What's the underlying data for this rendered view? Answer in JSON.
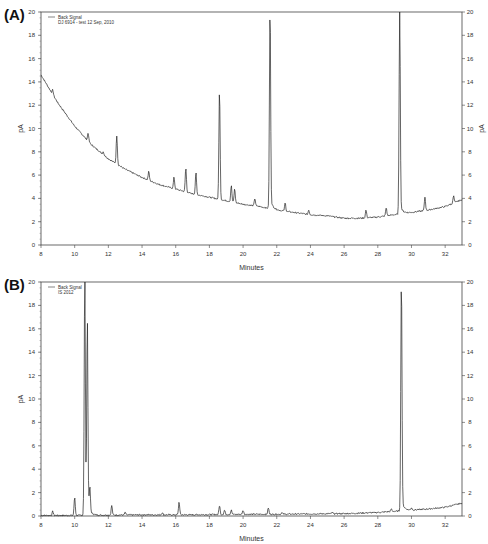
{
  "chart_data": [
    {
      "panel": "(A)",
      "type": "line",
      "title": "",
      "xlabel": "Minutes",
      "ylabel": "pA",
      "ylabel_right": "pA",
      "xlim": [
        8,
        33
      ],
      "ylim": [
        0,
        20
      ],
      "xticks": [
        8,
        10,
        12,
        14,
        16,
        18,
        20,
        22,
        24,
        26,
        28,
        30,
        32
      ],
      "yticks": [
        0,
        2,
        4,
        6,
        8,
        10,
        12,
        14,
        16,
        18,
        20
      ],
      "grid": false,
      "legend": {
        "position": "top-left",
        "entries": [
          "Back Signal",
          "DJ 6914 - test 12 Sep, 2010"
        ]
      },
      "baseline": {
        "x": [
          8,
          9,
          10,
          11,
          12,
          13,
          14,
          15,
          16,
          17,
          18,
          19,
          20,
          21,
          22,
          23,
          24,
          25,
          26,
          27,
          28,
          29,
          30,
          31,
          32,
          33
        ],
        "y": [
          14.6,
          12.2,
          10.2,
          8.6,
          7.4,
          6.5,
          5.8,
          5.2,
          4.8,
          4.4,
          4.1,
          3.8,
          3.5,
          3.3,
          3.0,
          2.8,
          2.6,
          2.5,
          2.3,
          2.3,
          2.4,
          2.6,
          2.8,
          3.0,
          3.3,
          3.9
        ]
      },
      "peaks": [
        {
          "x": 8.7,
          "y": 13.3
        },
        {
          "x": 10.8,
          "y": 9.6
        },
        {
          "x": 11.7,
          "y": 8.0
        },
        {
          "x": 12.5,
          "y": 9.4
        },
        {
          "x": 14.4,
          "y": 6.3
        },
        {
          "x": 15.9,
          "y": 5.8
        },
        {
          "x": 16.6,
          "y": 6.6
        },
        {
          "x": 17.2,
          "y": 6.2
        },
        {
          "x": 18.6,
          "y": 13.3
        },
        {
          "x": 19.3,
          "y": 5.1
        },
        {
          "x": 19.5,
          "y": 4.8
        },
        {
          "x": 20.7,
          "y": 4.0
        },
        {
          "x": 21.6,
          "y": 20.0
        },
        {
          "x": 22.5,
          "y": 3.6
        },
        {
          "x": 23.9,
          "y": 3.0
        },
        {
          "x": 27.3,
          "y": 3.0
        },
        {
          "x": 28.5,
          "y": 3.2
        },
        {
          "x": 29.3,
          "y": 20.0
        },
        {
          "x": 30.8,
          "y": 4.1
        },
        {
          "x": 32.5,
          "y": 4.2
        }
      ]
    },
    {
      "panel": "(B)",
      "type": "line",
      "title": "",
      "xlabel": "Minutes",
      "ylabel": "pA",
      "ylabel_right": "",
      "xlim": [
        8,
        33
      ],
      "ylim": [
        0,
        20
      ],
      "xticks": [
        8,
        10,
        12,
        14,
        16,
        18,
        20,
        22,
        24,
        26,
        28,
        30,
        32
      ],
      "yticks": [
        0,
        2,
        4,
        6,
        8,
        10,
        12,
        14,
        16,
        18,
        20
      ],
      "grid": false,
      "legend": {
        "position": "top-left",
        "entries": [
          "Back Signal",
          "IS 2012"
        ]
      },
      "baseline": {
        "x": [
          8,
          10,
          12,
          14,
          16,
          18,
          20,
          22,
          24,
          26,
          28,
          29,
          30,
          31,
          32,
          33
        ],
        "y": [
          0.05,
          0.05,
          0.08,
          0.1,
          0.1,
          0.12,
          0.15,
          0.15,
          0.18,
          0.2,
          0.3,
          0.4,
          0.5,
          0.6,
          0.75,
          1.1
        ]
      },
      "peaks": [
        {
          "x": 8.7,
          "y": 0.4
        },
        {
          "x": 10.0,
          "y": 1.6
        },
        {
          "x": 10.6,
          "y": 20.0
        },
        {
          "x": 10.75,
          "y": 16.0
        },
        {
          "x": 10.9,
          "y": 2.1
        },
        {
          "x": 12.2,
          "y": 0.9
        },
        {
          "x": 13.0,
          "y": 0.3
        },
        {
          "x": 15.2,
          "y": 0.3
        },
        {
          "x": 16.2,
          "y": 1.2
        },
        {
          "x": 18.6,
          "y": 0.9
        },
        {
          "x": 18.9,
          "y": 0.5
        },
        {
          "x": 19.3,
          "y": 0.5
        },
        {
          "x": 20.0,
          "y": 0.5
        },
        {
          "x": 21.5,
          "y": 0.7
        },
        {
          "x": 22.3,
          "y": 0.3
        },
        {
          "x": 25.3,
          "y": 0.3
        },
        {
          "x": 28.8,
          "y": 0.6
        },
        {
          "x": 29.4,
          "y": 20.0
        },
        {
          "x": 30.0,
          "y": 0.7
        },
        {
          "x": 32.4,
          "y": 0.9
        }
      ]
    }
  ],
  "panels": [
    {
      "label": "(A)",
      "xlabel": "Minutes",
      "ylabel": "pA",
      "legend_line1": "Back Signal",
      "legend_line2": "DJ 6914 - test 12 Sep, 2010"
    },
    {
      "label": "(B)",
      "xlabel": "Minutes",
      "ylabel": "pA",
      "legend_line1": "Back Signal",
      "legend_line2": "IS 2012"
    }
  ]
}
